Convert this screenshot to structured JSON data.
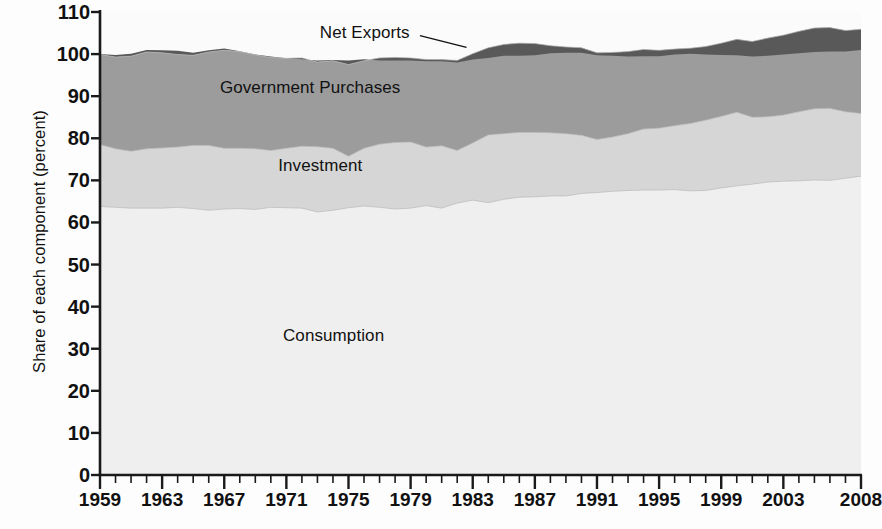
{
  "chart_data": {
    "type": "area",
    "stacked": true,
    "title": "",
    "subtitle": "",
    "xlabel": "",
    "ylabel": "Share of each component (percent)",
    "xlim": [
      1959,
      2008
    ],
    "ylim": [
      0,
      110
    ],
    "ytick_step": 10,
    "grid": false,
    "legend_position": "inline-annotations",
    "y_ticks": [
      0,
      10,
      20,
      30,
      40,
      50,
      60,
      70,
      80,
      90,
      100,
      110
    ],
    "x_ticks": [
      1959,
      1963,
      1967,
      1971,
      1975,
      1979,
      1983,
      1987,
      1991,
      1995,
      1999,
      2003,
      2008
    ],
    "x_minor_tick_interval": 1,
    "annotations": [
      {
        "text": "Net Exports",
        "series": "Net Exports",
        "leader_line": true
      },
      {
        "text": "Government Purchases",
        "series": "Government Purchases",
        "leader_line": false
      },
      {
        "text": "Investment",
        "series": "Investment",
        "leader_line": false
      },
      {
        "text": "Consumption",
        "series": "Consumption",
        "leader_line": false
      }
    ],
    "colors": {
      "consumption": "#efefef",
      "investment": "#d6d6d6",
      "government": "#9c9c9c",
      "net_exports": "#595959",
      "axis": "#1a1a1a",
      "background": "#fdfdfd"
    },
    "x": [
      1959,
      1960,
      1961,
      1962,
      1963,
      1964,
      1965,
      1966,
      1967,
      1968,
      1969,
      1970,
      1971,
      1972,
      1973,
      1974,
      1975,
      1976,
      1977,
      1978,
      1979,
      1980,
      1981,
      1982,
      1983,
      1984,
      1985,
      1986,
      1987,
      1988,
      1989,
      1990,
      1991,
      1992,
      1993,
      1994,
      1995,
      1996,
      1997,
      1998,
      1999,
      2000,
      2001,
      2002,
      2003,
      2004,
      2005,
      2006,
      2007,
      2008
    ],
    "series": [
      {
        "name": "Consumption",
        "color": "#efefef",
        "values": [
          63.8,
          63.6,
          63.4,
          63.4,
          63.4,
          63.6,
          63.3,
          62.9,
          63.2,
          63.3,
          63.1,
          63.6,
          63.5,
          63.4,
          62.5,
          62.9,
          63.5,
          63.9,
          63.6,
          63.2,
          63.4,
          64.0,
          63.4,
          64.6,
          65.3,
          64.7,
          65.5,
          66.0,
          66.1,
          66.3,
          66.3,
          66.9,
          67.1,
          67.4,
          67.6,
          67.7,
          67.7,
          67.8,
          67.5,
          67.6,
          68.2,
          68.7,
          69.1,
          69.6,
          69.8,
          69.9,
          70.1,
          70.0,
          70.5,
          71.0
        ]
      },
      {
        "name": "Investment",
        "color": "#d6d6d6",
        "values": [
          14.7,
          13.9,
          13.5,
          14.1,
          14.3,
          14.3,
          15.0,
          15.4,
          14.4,
          14.3,
          14.4,
          13.5,
          14.1,
          14.7,
          15.5,
          14.7,
          12.2,
          13.7,
          15.0,
          15.8,
          15.7,
          13.9,
          14.8,
          12.5,
          13.6,
          16.1,
          15.6,
          15.4,
          15.3,
          15.0,
          14.8,
          13.8,
          12.6,
          12.9,
          13.5,
          14.5,
          14.7,
          15.2,
          16.0,
          16.7,
          17.0,
          17.5,
          15.9,
          15.5,
          15.7,
          16.4,
          16.9,
          17.1,
          15.8,
          14.9
        ]
      },
      {
        "name": "Government Purchases",
        "color": "#9c9c9c",
        "values": [
          21.4,
          21.8,
          22.6,
          23.0,
          22.6,
          22.0,
          21.4,
          22.2,
          23.3,
          23.0,
          22.3,
          22.1,
          21.4,
          21.0,
          20.1,
          20.8,
          21.8,
          20.8,
          20.5,
          20.2,
          20.0,
          20.8,
          20.5,
          21.4,
          21.2,
          20.7,
          21.2,
          21.2,
          21.1,
          20.7,
          20.6,
          20.8,
          20.6,
          20.1,
          19.5,
          18.9,
          18.5,
          18.2,
          17.9,
          17.5,
          17.4,
          17.3,
          18.0,
          18.7,
          19.0,
          19.1,
          19.2,
          19.2,
          19.3,
          20.0
        ]
      },
      {
        "name": "Net Exports",
        "color": "#595959",
        "values": [
          0.1,
          0.5,
          0.6,
          0.5,
          0.6,
          0.9,
          0.6,
          0.4,
          0.4,
          0.1,
          0.1,
          0.2,
          0.0,
          -0.3,
          0.4,
          0.2,
          1.0,
          0.4,
          -0.6,
          -0.7,
          -0.6,
          -0.4,
          -0.4,
          -0.5,
          -1.4,
          -2.4,
          -2.7,
          -3.0,
          -2.8,
          -1.8,
          -1.4,
          -1.2,
          -0.6,
          -0.8,
          -1.2,
          -1.6,
          -1.4,
          -1.3,
          -1.3,
          -1.9,
          -2.8,
          -3.8,
          -3.6,
          -4.2,
          -4.6,
          -5.2,
          -5.7,
          -5.7,
          -5.0,
          -4.9
        ]
      }
    ]
  },
  "axis": {
    "y_title": "Share of each component (percent)"
  },
  "labels": {
    "net_exports": "Net Exports",
    "government_purchases": "Government Purchases",
    "investment": "Investment",
    "consumption": "Consumption"
  }
}
